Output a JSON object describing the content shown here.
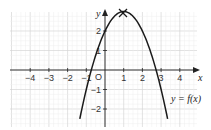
{
  "chart_data": {
    "type": "line",
    "title": "",
    "xlabel": "x",
    "ylabel": "y",
    "origin_label": "O",
    "xlim": [
      -5,
      5
    ],
    "ylim": [
      -3,
      3
    ],
    "x_ticks": [
      "−4",
      "−3",
      "−2",
      "−1",
      "1",
      "2",
      "3",
      "4"
    ],
    "y_ticks": [
      "2",
      "1",
      "−1",
      "−2"
    ],
    "grid": true,
    "series": [
      {
        "name": "y = f(x)",
        "equation": "f(x) = -(x-1)^2 + 3",
        "x": [
          -1.5,
          -1,
          -0.73,
          0,
          1,
          2,
          2.73,
          3,
          3.5
        ],
        "values": [
          -3.25,
          -1,
          0,
          2,
          3,
          2,
          0,
          -1,
          -3.25
        ]
      }
    ],
    "annotations": [
      {
        "type": "cross-marker",
        "x": 1,
        "y": 3,
        "label": "maximum point"
      },
      {
        "type": "curve-label",
        "text": "y = f(x)"
      }
    ]
  }
}
